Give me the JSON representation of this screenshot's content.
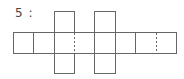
{
  "figure": {
    "label": "5 :",
    "line_color": "#666666",
    "strip": {
      "x_lines": [
        13,
        33,
        54,
        74,
        94,
        115,
        135,
        156,
        177
      ],
      "dashed_x_lines": [
        74,
        156
      ],
      "top": 32,
      "bottom": 53
    },
    "flaps": [
      {
        "x": 54,
        "w": 20,
        "y": 11,
        "h": 21,
        "position": "top"
      },
      {
        "x": 54,
        "w": 20,
        "y": 53,
        "h": 20,
        "position": "bottom"
      },
      {
        "x": 94,
        "w": 21,
        "y": 11,
        "h": 21,
        "position": "top"
      },
      {
        "x": 94,
        "w": 21,
        "y": 53,
        "h": 20,
        "position": "bottom"
      }
    ]
  }
}
